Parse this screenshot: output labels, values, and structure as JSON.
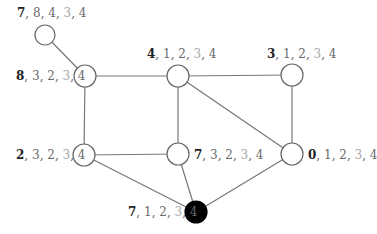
{
  "diagram": {
    "type": "graph",
    "colors": {
      "edge": "#777777",
      "node_stroke": "#666666",
      "node_fill": "#ffffff",
      "highlight_node_fill": "#000000",
      "label_primary": "#222222",
      "label_secondary": "#6a6a6a",
      "label_faded": "#a8a8a8"
    },
    "nodes": [
      {
        "id": "n_top",
        "x": 45,
        "y": 35,
        "filled": false,
        "label": {
          "v0": "7",
          "v1": "8",
          "v2": "4",
          "v3": "3",
          "v4": "4"
        }
      },
      {
        "id": "n_8",
        "x": 85,
        "y": 76,
        "filled": false,
        "label": {
          "v0": "8",
          "v1": "3",
          "v2": "2",
          "v3": "3",
          "v4": "4"
        }
      },
      {
        "id": "n_4",
        "x": 178,
        "y": 76,
        "filled": false,
        "label": {
          "v0": "4",
          "v1": "1",
          "v2": "2",
          "v3": "3",
          "v4": "4"
        }
      },
      {
        "id": "n_3",
        "x": 292,
        "y": 75,
        "filled": false,
        "label": {
          "v0": "3",
          "v1": "1",
          "v2": "2",
          "v3": "3",
          "v4": "4"
        }
      },
      {
        "id": "n_2",
        "x": 84,
        "y": 155,
        "filled": false,
        "label": {
          "v0": "2",
          "v1": "3",
          "v2": "2",
          "v3": "3",
          "v4": "4"
        }
      },
      {
        "id": "n_7m",
        "x": 178,
        "y": 154,
        "filled": false,
        "label": {
          "v0": "7",
          "v1": "3",
          "v2": "2",
          "v3": "3",
          "v4": "4"
        }
      },
      {
        "id": "n_0",
        "x": 292,
        "y": 154,
        "filled": false,
        "label": {
          "v0": "0",
          "v1": "1",
          "v2": "2",
          "v3": "3",
          "v4": "4"
        }
      },
      {
        "id": "n_black",
        "x": 196,
        "y": 212,
        "filled": true,
        "label": {
          "v0": "7",
          "v1": "1",
          "v2": "2",
          "v3": "3",
          "v4": "4"
        }
      }
    ],
    "edges": [
      [
        "n_top",
        "n_8"
      ],
      [
        "n_8",
        "n_4"
      ],
      [
        "n_4",
        "n_3"
      ],
      [
        "n_8",
        "n_2"
      ],
      [
        "n_4",
        "n_7m"
      ],
      [
        "n_4",
        "n_0"
      ],
      [
        "n_3",
        "n_0"
      ],
      [
        "n_2",
        "n_7m"
      ],
      [
        "n_2",
        "n_black"
      ],
      [
        "n_7m",
        "n_black"
      ],
      [
        "n_0",
        "n_black"
      ]
    ]
  }
}
